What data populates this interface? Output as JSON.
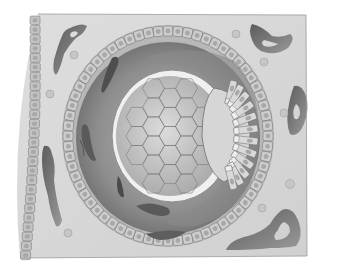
{
  "illustration": {
    "subject": "Cross-section of tissue with a follicle-like structure",
    "style": "grayscale shaded biological illustration",
    "colors": {
      "background": "#ffffff",
      "stroma": "#d8d8d8",
      "stroma_light": "#e2e2e2",
      "epithelium": "#c4c4c4",
      "cell_outline": "#6e6e6e",
      "nucleus": "#a8a8a8",
      "vessel_dark": "#6a6a6a",
      "vessel_mid": "#8c8c8c",
      "antrum": "#9a9a9a",
      "oocyte": "#c8c8c8",
      "zona": "#f2f2f2",
      "spindle_cell": "#5a5a5a"
    },
    "labels": []
  }
}
